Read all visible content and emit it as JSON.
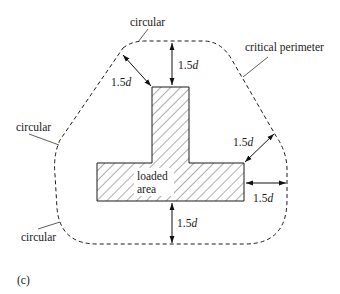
{
  "figure": {
    "panel_label": "(c)",
    "loaded_area": {
      "line1": "loaded",
      "line2": "area"
    },
    "labels": {
      "circular_top": "circular",
      "circular_left": "circular",
      "circular_bottom": "circular",
      "critical_perimeter": "critical perimeter"
    },
    "dimensions": {
      "top_left": {
        "num": "1.5",
        "var": "d"
      },
      "top": {
        "num": "1.5",
        "var": "d"
      },
      "right_diag": {
        "num": "1.5",
        "var": "d"
      },
      "right": {
        "num": "1.5",
        "var": "d"
      },
      "bottom": {
        "num": "1.5",
        "var": "d"
      }
    },
    "colors": {
      "line": "#1a1a1a",
      "background": "#ffffff"
    }
  }
}
